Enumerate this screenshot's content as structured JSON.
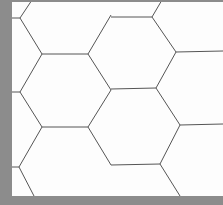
{
  "image": {
    "description": "hexagon grid pattern",
    "colors": {
      "frame": "#8c8c8c",
      "background": "#fdfdfd",
      "line": "#555555"
    }
  },
  "lines": [
    [
      0,
      18,
      20,
      18
    ],
    [
      20,
      18,
      32,
      0
    ],
    [
      20,
      18,
      42,
      54
    ],
    [
      42,
      54,
      88,
      54
    ],
    [
      88,
      54,
      111,
      15
    ],
    [
      88,
      54,
      111,
      90
    ],
    [
      42,
      54,
      20,
      92
    ],
    [
      20,
      92,
      12,
      92
    ],
    [
      111,
      17,
      152,
      17
    ],
    [
      152,
      17,
      162,
      0
    ],
    [
      152,
      17,
      176,
      52
    ],
    [
      176,
      52,
      223,
      51
    ],
    [
      176,
      52,
      156,
      88
    ],
    [
      156,
      88,
      111,
      89
    ],
    [
      20,
      92,
      42,
      127
    ],
    [
      42,
      127,
      88,
      127
    ],
    [
      88,
      127,
      111,
      90
    ],
    [
      42,
      127,
      19,
      167
    ],
    [
      12,
      167,
      19,
      167
    ],
    [
      19,
      167,
      34,
      196
    ],
    [
      88,
      127,
      111,
      165
    ],
    [
      156,
      88,
      180,
      125
    ],
    [
      180,
      125,
      223,
      124
    ],
    [
      180,
      125,
      160,
      164
    ],
    [
      160,
      164,
      111,
      165
    ],
    [
      160,
      164,
      180,
      196
    ]
  ]
}
